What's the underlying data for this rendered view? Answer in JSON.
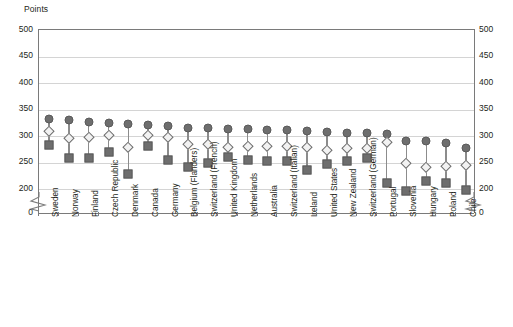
{
  "chart_data": {
    "type": "scatter",
    "title": "",
    "ylabel": "Points",
    "xlabel": "",
    "ylim": [
      200,
      500
    ],
    "yticks": [
      500,
      450,
      400,
      350,
      300,
      250,
      200,
      0
    ],
    "axis_break": true,
    "axis_break_between": [
      0,
      200
    ],
    "grid": true,
    "legend_position": "none",
    "categories": [
      "Sweden",
      "Norway",
      "Finland",
      "Czech Republic",
      "Denmark",
      "Canada",
      "Germany",
      "Belgium (Flanders)",
      "Switzerland (French)",
      "United Kingdom",
      "Netherlands",
      "Australia",
      "Switzerland (Italian)",
      "Ireland",
      "United States",
      "New Zealand",
      "Switzerland (German)",
      "Portugal",
      "Slovenia",
      "Hungary",
      "Poland",
      "Chile"
    ],
    "series": [
      {
        "name": "upper",
        "marker": "filled-circle",
        "values": [
          332,
          330,
          326,
          324,
          322,
          320,
          318,
          316,
          315,
          314,
          313,
          312,
          311,
          310,
          308,
          306,
          305,
          303,
          291,
          290,
          286,
          278
        ]
      },
      {
        "name": "middle",
        "marker": "open-diamond",
        "values": [
          309,
          297,
          298,
          301,
          279,
          301,
          299,
          284,
          285,
          280,
          281,
          282,
          281,
          279,
          274,
          277,
          278,
          288,
          250,
          242,
          243,
          245
        ]
      },
      {
        "name": "lower",
        "marker": "filled-square",
        "values": [
          283,
          259,
          259,
          269,
          228,
          281,
          255,
          241,
          250,
          261,
          254,
          252,
          253,
          236,
          248,
          253,
          259,
          211,
          196,
          215,
          212,
          198
        ]
      }
    ]
  }
}
